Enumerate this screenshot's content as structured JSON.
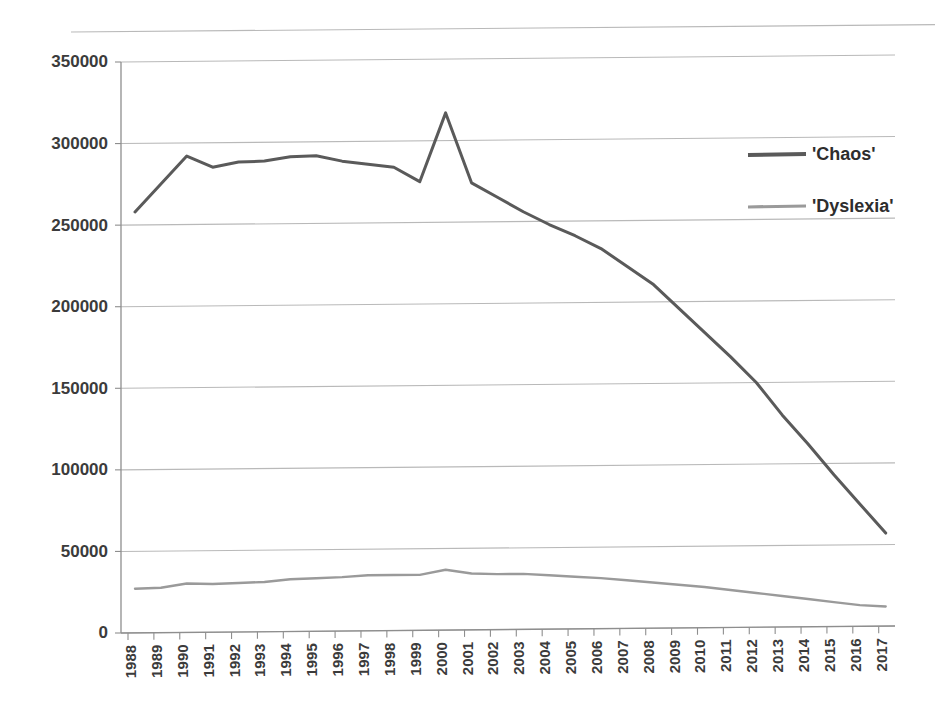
{
  "chart_data": {
    "type": "line",
    "title": "",
    "subtitle": "",
    "xlabel": "",
    "ylabel": "",
    "grid": true,
    "legend_position": "right-top",
    "ylim": [
      0,
      350000
    ],
    "ytick_labels": [
      "0",
      "50000",
      "100000",
      "150000",
      "200000",
      "250000",
      "300000",
      "350000"
    ],
    "ytick_values": [
      0,
      50000,
      100000,
      150000,
      200000,
      250000,
      300000,
      350000
    ],
    "categories": [
      "1988",
      "1989",
      "1990",
      "1991",
      "1992",
      "1993",
      "1994",
      "1995",
      "1996",
      "1997",
      "1998",
      "1999",
      "2000",
      "2001",
      "2002",
      "2003",
      "2004",
      "2005",
      "2006",
      "2007",
      "2008",
      "2009",
      "2010",
      "2011",
      "2012",
      "2013",
      "2014",
      "2015",
      "2016",
      "2017"
    ],
    "x": [
      1988,
      1989,
      1990,
      1991,
      1992,
      1993,
      1994,
      1995,
      1996,
      1997,
      1998,
      1999,
      2000,
      2001,
      2002,
      2003,
      2004,
      2005,
      2006,
      2007,
      2008,
      2009,
      2010,
      2011,
      2012,
      2013,
      2014,
      2015,
      2016,
      2017
    ],
    "series": [
      {
        "name": "'Chaos'",
        "color": "#5a5a5a",
        "values": [
          258000,
          275000,
          292000,
          285000,
          288000,
          288500,
          291000,
          291500,
          288000,
          286000,
          284000,
          275000,
          317000,
          274000,
          265000,
          256000,
          248000,
          241000,
          233000,
          222000,
          211000,
          196000,
          181000,
          166000,
          150000,
          130000,
          112000,
          93000,
          75000,
          57000
        ]
      },
      {
        "name": "'Dyslexia'",
        "color": "#9a9a9a",
        "values": [
          27000,
          27500,
          30000,
          29500,
          30000,
          30500,
          32000,
          32500,
          33000,
          34000,
          34000,
          34000,
          37000,
          34500,
          34000,
          34000,
          33000,
          32000,
          31000,
          29500,
          28000,
          26500,
          25000,
          23000,
          21000,
          19000,
          17000,
          15000,
          13000,
          12000
        ]
      }
    ]
  },
  "legend": {
    "items": [
      {
        "label": "'Chaos'",
        "color": "#5a5a5a"
      },
      {
        "label": "'Dyslexia'",
        "color": "#9a9a9a"
      }
    ]
  }
}
